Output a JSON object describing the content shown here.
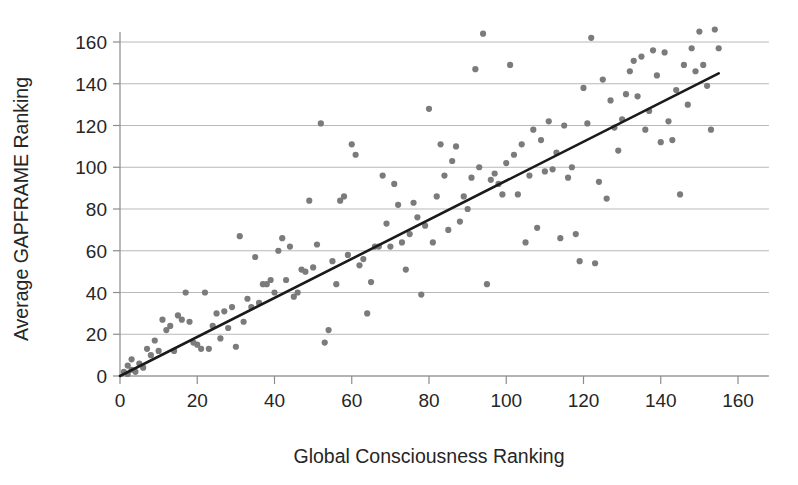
{
  "chart_data": {
    "type": "scatter",
    "title": "",
    "xlabel": "Global Consciousness  Ranking",
    "ylabel": "Average GAPFRAME Ranking",
    "xlim": [
      0,
      168
    ],
    "ylim": [
      0,
      168
    ],
    "xticks": [
      0,
      20,
      40,
      60,
      80,
      100,
      120,
      140,
      160
    ],
    "yticks": [
      0,
      20,
      40,
      60,
      80,
      100,
      120,
      140,
      160
    ],
    "grid": "horizontal",
    "legend": "none",
    "point_color": "#7b7b7b",
    "line_color": "#1a1a1a",
    "grid_color": "#b9b9b9",
    "background_color": "#ffffff",
    "series": [
      {
        "name": "Countries",
        "marker": "circle",
        "points": [
          [
            1,
            2
          ],
          [
            2,
            1
          ],
          [
            2,
            5
          ],
          [
            3,
            3
          ],
          [
            3,
            8
          ],
          [
            4,
            2
          ],
          [
            5,
            6
          ],
          [
            6,
            4
          ],
          [
            7,
            13
          ],
          [
            8,
            10
          ],
          [
            9,
            17
          ],
          [
            10,
            12
          ],
          [
            11,
            27
          ],
          [
            12,
            22
          ],
          [
            13,
            24
          ],
          [
            14,
            12
          ],
          [
            15,
            29
          ],
          [
            16,
            27
          ],
          [
            17,
            40
          ],
          [
            18,
            26
          ],
          [
            19,
            16
          ],
          [
            20,
            15
          ],
          [
            21,
            13
          ],
          [
            22,
            40
          ],
          [
            23,
            13
          ],
          [
            24,
            24
          ],
          [
            25,
            30
          ],
          [
            26,
            18
          ],
          [
            27,
            31
          ],
          [
            28,
            23
          ],
          [
            29,
            33
          ],
          [
            30,
            14
          ],
          [
            31,
            67
          ],
          [
            32,
            26
          ],
          [
            33,
            37
          ],
          [
            34,
            33
          ],
          [
            35,
            57
          ],
          [
            36,
            35
          ],
          [
            37,
            44
          ],
          [
            38,
            44
          ],
          [
            39,
            46
          ],
          [
            40,
            40
          ],
          [
            41,
            60
          ],
          [
            42,
            66
          ],
          [
            43,
            46
          ],
          [
            44,
            62
          ],
          [
            45,
            38
          ],
          [
            46,
            40
          ],
          [
            47,
            51
          ],
          [
            48,
            50
          ],
          [
            49,
            84
          ],
          [
            50,
            52
          ],
          [
            51,
            63
          ],
          [
            52,
            121
          ],
          [
            53,
            16
          ],
          [
            54,
            22
          ],
          [
            55,
            55
          ],
          [
            56,
            44
          ],
          [
            57,
            84
          ],
          [
            58,
            86
          ],
          [
            59,
            58
          ],
          [
            60,
            111
          ],
          [
            61,
            106
          ],
          [
            62,
            53
          ],
          [
            63,
            56
          ],
          [
            64,
            30
          ],
          [
            65,
            45
          ],
          [
            66,
            62
          ],
          [
            67,
            62
          ],
          [
            68,
            96
          ],
          [
            69,
            73
          ],
          [
            70,
            62
          ],
          [
            71,
            92
          ],
          [
            72,
            82
          ],
          [
            73,
            64
          ],
          [
            74,
            51
          ],
          [
            75,
            68
          ],
          [
            76,
            83
          ],
          [
            77,
            76
          ],
          [
            78,
            39
          ],
          [
            79,
            72
          ],
          [
            80,
            128
          ],
          [
            81,
            64
          ],
          [
            82,
            86
          ],
          [
            83,
            111
          ],
          [
            84,
            96
          ],
          [
            85,
            70
          ],
          [
            86,
            103
          ],
          [
            87,
            110
          ],
          [
            88,
            74
          ],
          [
            89,
            86
          ],
          [
            90,
            80
          ],
          [
            91,
            95
          ],
          [
            92,
            147
          ],
          [
            93,
            100
          ],
          [
            94,
            164
          ],
          [
            95,
            44
          ],
          [
            96,
            94
          ],
          [
            97,
            97
          ],
          [
            98,
            92
          ],
          [
            99,
            87
          ],
          [
            100,
            102
          ],
          [
            101,
            149
          ],
          [
            102,
            106
          ],
          [
            103,
            87
          ],
          [
            104,
            111
          ],
          [
            105,
            64
          ],
          [
            106,
            96
          ],
          [
            107,
            118
          ],
          [
            108,
            71
          ],
          [
            109,
            113
          ],
          [
            110,
            98
          ],
          [
            111,
            122
          ],
          [
            112,
            99
          ],
          [
            113,
            107
          ],
          [
            114,
            66
          ],
          [
            115,
            120
          ],
          [
            116,
            95
          ],
          [
            117,
            100
          ],
          [
            118,
            68
          ],
          [
            119,
            55
          ],
          [
            120,
            138
          ],
          [
            121,
            121
          ],
          [
            122,
            162
          ],
          [
            123,
            54
          ],
          [
            124,
            93
          ],
          [
            125,
            142
          ],
          [
            126,
            85
          ],
          [
            127,
            132
          ],
          [
            128,
            119
          ],
          [
            129,
            108
          ],
          [
            130,
            123
          ],
          [
            131,
            135
          ],
          [
            132,
            146
          ],
          [
            133,
            151
          ],
          [
            134,
            134
          ],
          [
            135,
            153
          ],
          [
            136,
            118
          ],
          [
            137,
            127
          ],
          [
            138,
            156
          ],
          [
            139,
            144
          ],
          [
            140,
            112
          ],
          [
            141,
            155
          ],
          [
            142,
            122
          ],
          [
            143,
            113
          ],
          [
            144,
            137
          ],
          [
            145,
            87
          ],
          [
            146,
            149
          ],
          [
            147,
            130
          ],
          [
            148,
            157
          ],
          [
            149,
            146
          ],
          [
            150,
            165
          ],
          [
            151,
            149
          ],
          [
            152,
            139
          ],
          [
            153,
            118
          ],
          [
            154,
            166
          ],
          [
            155,
            157
          ]
        ]
      }
    ],
    "trendline": {
      "name": "Linear fit",
      "x_start": 0,
      "y_start": 0,
      "x_end": 155,
      "y_end": 145
    }
  }
}
